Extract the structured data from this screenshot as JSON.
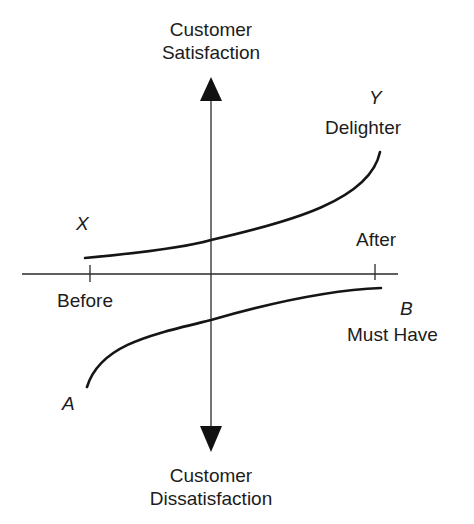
{
  "diagram": {
    "type": "kano-model",
    "vertical_axis": {
      "top_label_line1": "Customer",
      "top_label_line2": "Satisfaction",
      "bottom_label_line1": "Customer",
      "bottom_label_line2": "Dissatisfaction"
    },
    "horizontal_axis": {
      "left_tick_label": "Before",
      "right_tick_label": "After"
    },
    "curves": [
      {
        "id": "delighter",
        "start_point": "X",
        "end_point": "Y",
        "name": "Delighter",
        "path": "M85,258 C150,252 190,246 211,240 C290,222 370,200 380,152"
      },
      {
        "id": "must-have",
        "start_point": "A",
        "end_point": "B",
        "name": "Must Have",
        "path": "M87,387 C100,345 150,335 211,320 C270,303 330,290 381,288"
      }
    ],
    "colors": {
      "line": "#1a1a1a",
      "axis": "#2a2a2a",
      "background": "#ffffff"
    }
  }
}
